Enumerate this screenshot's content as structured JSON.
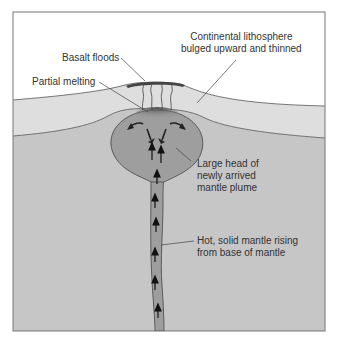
{
  "diagram": {
    "type": "cross-section",
    "colors": {
      "sky": "#ffffff",
      "lithosphere": "#dedede",
      "mantle": "#c6c6c6",
      "plume": "#9e9e9e",
      "melt": "#555555",
      "basalt": "#444444",
      "outline": "#444444",
      "text": "#333333"
    },
    "labels": {
      "basalt_floods": "Basalt floods",
      "partial_melting": "Partial melting",
      "lithosphere": [
        "Continental lithosphere",
        "bulged upward and thinned"
      ],
      "plume_head": [
        "Large head of",
        "newly arrived",
        "mantle plume"
      ],
      "plume_tail": [
        "Hot, solid mantle rising",
        "from base of mantle"
      ]
    }
  }
}
